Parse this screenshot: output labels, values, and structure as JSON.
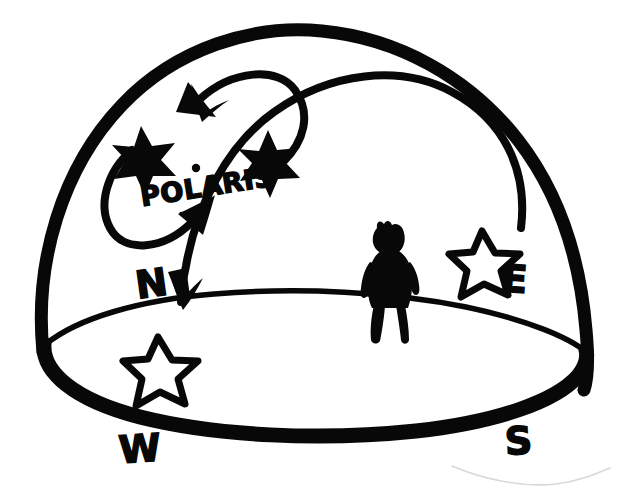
{
  "figure": {
    "background_color": "#ffffff",
    "ink_color": "#080808",
    "width": 622,
    "height": 504
  },
  "labels": {
    "polaris": "POLARIS",
    "north": "N",
    "east": "E",
    "south": "S",
    "west": "W"
  },
  "elements": {
    "dome": "sky-dome-outline",
    "horizon": "horizon-ellipse",
    "observer": "observer-silhouette",
    "circumpolar_arrow_top": "counterclockwise-arrow-top",
    "circumpolar_arrow_bottom": "counterclockwise-arrow-bottom",
    "star_trail_arc": "star-trail-arc",
    "trail_arrow": "star-trail-arrowhead",
    "polaris_pointer": "polaris-pointer-arrow",
    "filled_star_left": "filled-star-left",
    "filled_star_right": "filled-star-right",
    "outline_star_north": "outline-star-north-horizon",
    "outline_star_east": "outline-star-east-horizon"
  }
}
